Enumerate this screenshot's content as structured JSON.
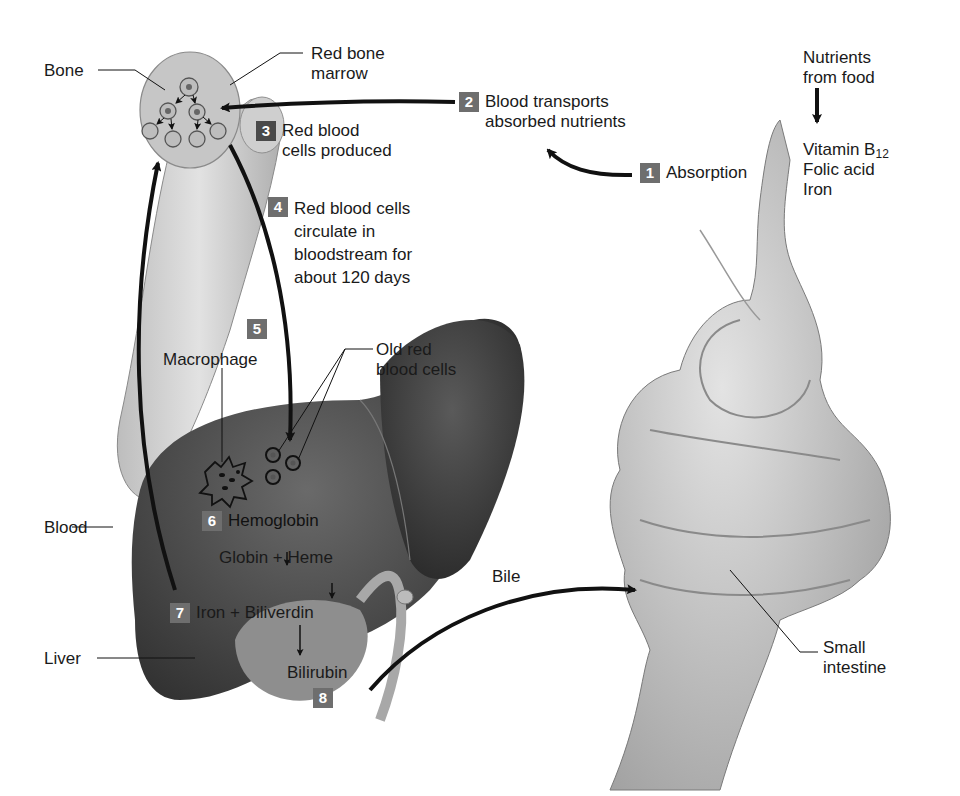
{
  "colors": {
    "step_badge": "#6b6b6b",
    "step_badge_dark": "#4a4a4a",
    "liver": "#3c3c3c",
    "bone": "#c9c9c9",
    "intestine": "#b8b8b8",
    "arrow": "#111111"
  },
  "labels": {
    "bone": "Bone",
    "red_bone_marrow": [
      "Red bone",
      "marrow"
    ],
    "nutrients_from_food": [
      "Nutrients",
      "from food"
    ],
    "nutrients_list": {
      "vitamin": "Vitamin B",
      "vitamin_sub": "12",
      "folic": "Folic acid",
      "iron": "Iron"
    },
    "macrophage": "Macrophage",
    "old_rbc": [
      "Old red",
      "blood cells"
    ],
    "blood": "Blood",
    "liver": "Liver",
    "globin_heme": "Globin + Heme",
    "bilirubin": "Bilirubin",
    "bile": "Bile",
    "small_intestine": [
      "Small",
      "intestine"
    ]
  },
  "steps": [
    {
      "num": "1",
      "text": [
        "Absorption"
      ]
    },
    {
      "num": "2",
      "text": [
        "Blood transports",
        "absorbed nutrients"
      ]
    },
    {
      "num": "3",
      "text": [
        "Red blood",
        "cells produced"
      ]
    },
    {
      "num": "4",
      "text": [
        "Red blood cells",
        "circulate in",
        "bloodstream for",
        "about 120 days"
      ]
    },
    {
      "num": "5",
      "text": []
    },
    {
      "num": "6",
      "text": [
        "Hemoglobin"
      ]
    },
    {
      "num": "7",
      "text": [
        "Iron + Biliverdin"
      ]
    },
    {
      "num": "8",
      "text": []
    }
  ]
}
